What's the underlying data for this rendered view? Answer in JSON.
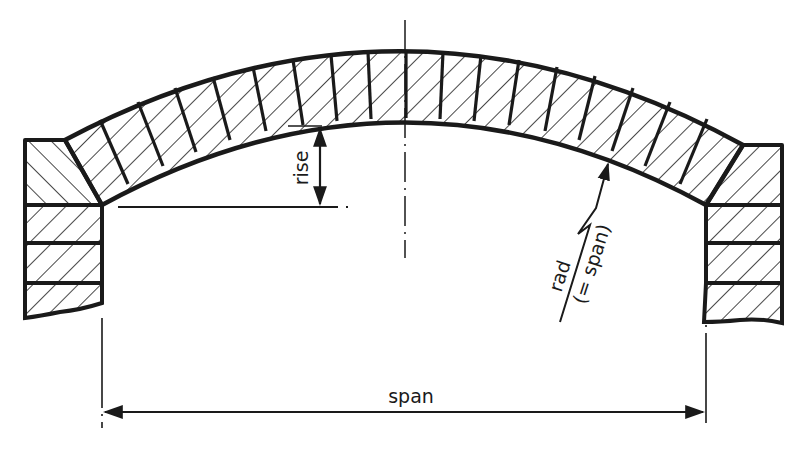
{
  "diagram": {
    "type": "technical-section-drawing",
    "colors": {
      "ink": "#1a1a1a",
      "background": "#ffffff"
    },
    "labels": {
      "rise": "rise",
      "rad": "rad",
      "rad_note": "(= span)",
      "span": "span"
    },
    "elements": {
      "arch": {
        "voussoir_count": 19,
        "hatch": "diagonal"
      },
      "left_pier": {
        "courses": 3,
        "skewback": true
      },
      "right_pier": {
        "courses": 3,
        "skewback": true
      },
      "centerline": true,
      "dimensions": [
        "rise",
        "rad (= span)",
        "span"
      ]
    }
  }
}
